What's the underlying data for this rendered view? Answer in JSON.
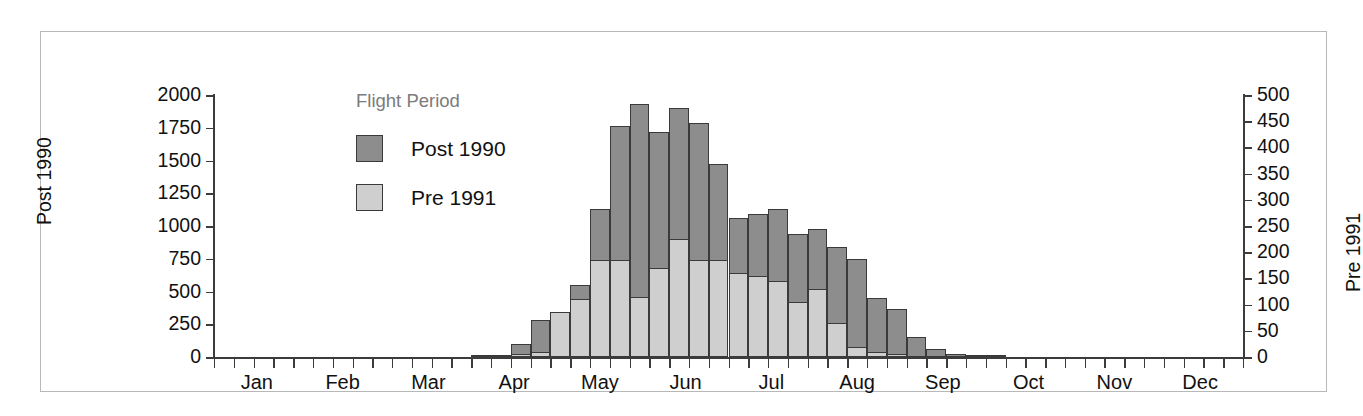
{
  "legend": {
    "title": "Flight Period",
    "entries": [
      {
        "label": "Post 1990",
        "color": "#8d8d8d"
      },
      {
        "label": "Pre 1991",
        "color": "#cfcfcf"
      }
    ]
  },
  "chart_data": {
    "type": "bar",
    "title": "",
    "subtitle": "",
    "stacked": false,
    "grid": false,
    "legend_position": "inside-top-left",
    "legend_title": "Flight Period",
    "xlabel": "",
    "ylabel": "Post 1990",
    "ylabel_right": "Pre 1991",
    "ylim": [
      0,
      2000
    ],
    "ylim_right": [
      0,
      500
    ],
    "yticks": [
      0,
      250,
      500,
      750,
      1000,
      1250,
      1500,
      1750,
      2000
    ],
    "yticks_right": [
      0,
      50,
      100,
      150,
      200,
      250,
      300,
      350,
      400,
      450,
      500
    ],
    "xtick_labels": [
      "Jan",
      "Feb",
      "Mar",
      "Apr",
      "May",
      "Jun",
      "Jul",
      "Aug",
      "Sep",
      "Oct",
      "Nov",
      "Dec"
    ],
    "x_units": "week",
    "n_bins": 52,
    "series": [
      {
        "name": "Post 1990",
        "axis": "left",
        "color": "#8d8d8d",
        "values": [
          0,
          0,
          0,
          0,
          0,
          0,
          0,
          0,
          0,
          0,
          0,
          0,
          0,
          10,
          15,
          100,
          280,
          320,
          550,
          1130,
          1760,
          1930,
          1720,
          1900,
          1790,
          1470,
          1060,
          1090,
          1130,
          940,
          980,
          840,
          750,
          450,
          370,
          150,
          60,
          20,
          10,
          5,
          0,
          0,
          0,
          0,
          0,
          0,
          0,
          0,
          0,
          0,
          0,
          0
        ]
      },
      {
        "name": "Pre 1991",
        "axis": "right",
        "color": "#cfcfcf",
        "values": [
          0,
          0,
          0,
          0,
          0,
          0,
          0,
          0,
          0,
          0,
          0,
          0,
          0,
          0,
          0,
          5,
          10,
          85,
          110,
          185,
          185,
          115,
          170,
          225,
          185,
          185,
          160,
          155,
          145,
          105,
          130,
          65,
          20,
          10,
          5,
          0,
          0,
          0,
          0,
          0,
          0,
          0,
          0,
          0,
          0,
          0,
          0,
          0,
          0,
          0,
          0,
          0
        ]
      }
    ]
  }
}
